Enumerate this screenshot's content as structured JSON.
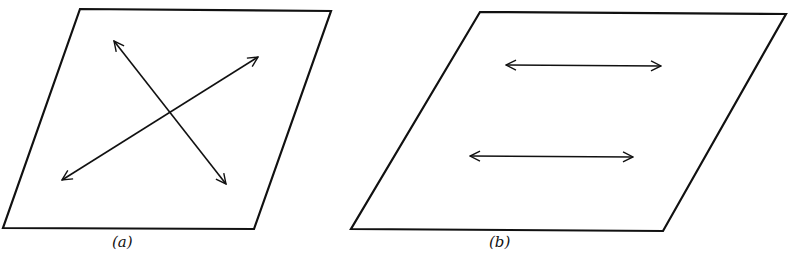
{
  "figure": {
    "panels": [
      {
        "id": "a",
        "label": "(a)",
        "shape": "parallelogram",
        "vertices": [
          [
            80,
            9
          ],
          [
            331,
            11
          ],
          [
            254,
            229
          ],
          [
            3,
            228
          ]
        ],
        "arrows": [
          {
            "from": [
              114,
              41
            ],
            "to": [
              226,
              184
            ],
            "double_headed": true
          },
          {
            "from": [
              62,
              180
            ],
            "to": [
              258,
              57
            ],
            "double_headed": true
          }
        ]
      },
      {
        "id": "b",
        "label": "(b)",
        "shape": "parallelogram",
        "vertices": [
          [
            480,
            12
          ],
          [
            786,
            14
          ],
          [
            663,
            231
          ],
          [
            351,
            229
          ]
        ],
        "arrows": [
          {
            "from": [
              506,
              65
            ],
            "to": [
              661,
              66
            ],
            "double_headed": true
          },
          {
            "from": [
              470,
              156
            ],
            "to": [
              633,
              157
            ],
            "double_headed": true
          }
        ]
      }
    ],
    "caption": ""
  },
  "colors": {
    "stroke": "#111111",
    "background": "#ffffff"
  }
}
